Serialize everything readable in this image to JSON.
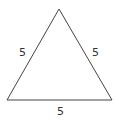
{
  "diagram": {
    "shape": "equilateral-triangle",
    "stroke_color": "#444444",
    "vertices": [
      [
        59,
        9
      ],
      [
        7,
        100
      ],
      [
        112,
        100
      ]
    ],
    "labels": {
      "left_side": "5",
      "right_side": "5",
      "bottom_side": "5"
    }
  }
}
